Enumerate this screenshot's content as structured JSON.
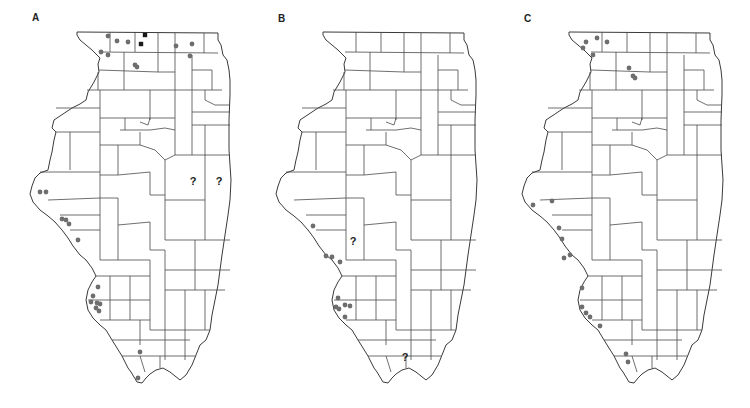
{
  "figure": {
    "panels": [
      {
        "label": "A",
        "label_pos": [
          32,
          12
        ],
        "offset_x": 0,
        "dots": [
          [
            108,
            36
          ],
          [
            117,
            41
          ],
          [
            128,
            42
          ],
          [
            101,
            52
          ],
          [
            108,
            55
          ],
          [
            135,
            65
          ],
          [
            137,
            67
          ],
          [
            176,
            46
          ],
          [
            192,
            44
          ],
          [
            190,
            56
          ],
          [
            40,
            192
          ],
          [
            46,
            192
          ],
          [
            62,
            219
          ],
          [
            66,
            220
          ],
          [
            69,
            224
          ],
          [
            78,
            240
          ],
          [
            98,
            287
          ],
          [
            93,
            296
          ],
          [
            91,
            302
          ],
          [
            97,
            303
          ],
          [
            100,
            304
          ],
          [
            96,
            308
          ],
          [
            99,
            311
          ],
          [
            140,
            352
          ],
          [
            138,
            378
          ]
        ],
        "squares": [
          [
            145,
            35
          ],
          [
            141,
            44
          ]
        ],
        "question_marks": [
          [
            193,
            185
          ],
          [
            219,
            185
          ]
        ]
      },
      {
        "label": "B",
        "label_pos": [
          278,
          13
        ],
        "offset_x": 246,
        "dots": [
          [
            313,
            226
          ],
          [
            326,
            256
          ],
          [
            332,
            257
          ],
          [
            340,
            262
          ],
          [
            338,
            298
          ],
          [
            336,
            307
          ],
          [
            339,
            309
          ],
          [
            345,
            305
          ],
          [
            350,
            306
          ],
          [
            345,
            317
          ]
        ],
        "squares": [],
        "question_marks": [
          [
            353,
            245
          ],
          [
            405,
            361
          ]
        ]
      },
      {
        "label": "C",
        "label_pos": [
          524,
          13
        ],
        "offset_x": 492,
        "dots": [
          [
            586,
            42
          ],
          [
            597,
            38
          ],
          [
            607,
            42
          ],
          [
            583,
            48
          ],
          [
            593,
            55
          ],
          [
            629,
            68
          ],
          [
            633,
            76
          ],
          [
            635,
            78
          ],
          [
            533,
            205
          ],
          [
            552,
            201
          ],
          [
            559,
            228
          ],
          [
            562,
            239
          ],
          [
            570,
            255
          ],
          [
            564,
            258
          ],
          [
            582,
            288
          ],
          [
            582,
            307
          ],
          [
            586,
            313
          ],
          [
            590,
            317
          ],
          [
            600,
            326
          ],
          [
            626,
            354
          ],
          [
            628,
            362
          ]
        ],
        "squares": [],
        "question_marks": []
      }
    ],
    "legend": {
      "dot_meaning": "gray-dot-record",
      "square_meaning": "black-square-record",
      "question_meaning": "uncertain-record"
    },
    "colors": {
      "dot": "#6e6e6e",
      "square": "#1a1a1a",
      "outline": "#3a3a3a",
      "background": "#ffffff"
    }
  }
}
